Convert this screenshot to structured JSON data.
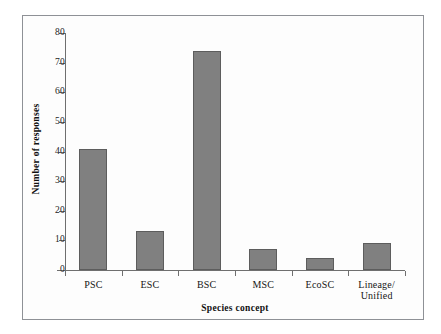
{
  "chart_data": {
    "type": "bar",
    "title": "",
    "xlabel": "Species concept",
    "ylabel": "Number of responses",
    "categories": [
      "PSC",
      "ESC",
      "BSC",
      "MSC",
      "EcoSC",
      "Lineage/\nUnified"
    ],
    "category_labels": [
      {
        "line1": "PSC",
        "line2": ""
      },
      {
        "line1": "ESC",
        "line2": ""
      },
      {
        "line1": "BSC",
        "line2": ""
      },
      {
        "line1": "MSC",
        "line2": ""
      },
      {
        "line1": "EcoSC",
        "line2": ""
      },
      {
        "line1": "Lineage/",
        "line2": "Unified"
      }
    ],
    "values": [
      41,
      13,
      74,
      7,
      4,
      9
    ],
    "ylim": [
      0,
      80
    ],
    "ytick_step": 10,
    "yticks": [
      80,
      70,
      60,
      50,
      40,
      30,
      20,
      10,
      0
    ],
    "ytick_labels": [
      "80",
      "70",
      "60",
      "50",
      "40",
      "30",
      "20",
      "10",
      "0"
    ],
    "grid": false,
    "legend": false,
    "bar_color": "#808080",
    "bar_border_color": "#5d5d5d",
    "axis_color": "#6f6f6f",
    "frame_color": "#8e9196",
    "background": "#fdfdfd"
  }
}
